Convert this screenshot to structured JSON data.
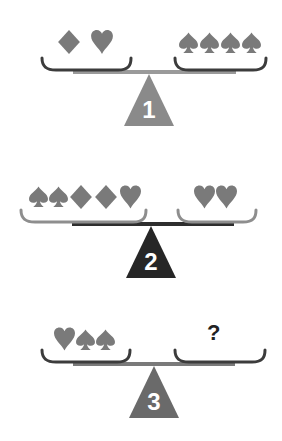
{
  "puzzle": {
    "type": "balance-scale-puzzle",
    "suits_color": "#7a7a7a",
    "scales": [
      {
        "number": "1",
        "left": [
          "diamond",
          "heart"
        ],
        "right": [
          "spade",
          "spade",
          "spade",
          "spade"
        ],
        "triangle_color": "#8a8a8a",
        "beam_color": "#9a9a9a",
        "pan_color": "#3c3c3c"
      },
      {
        "number": "2",
        "left": [
          "spade",
          "spade",
          "diamond",
          "diamond",
          "heart"
        ],
        "right": [
          "heart",
          "heart"
        ],
        "triangle_color": "#262626",
        "beam_color": "#2e2e2e",
        "pan_color": "#8e8e8e"
      },
      {
        "number": "3",
        "left": [
          "heart",
          "spade",
          "spade"
        ],
        "right_label": "?",
        "triangle_color": "#6a6a6a",
        "beam_color": "#7a7a7a",
        "pan_color": "#3c3c3c"
      }
    ]
  }
}
